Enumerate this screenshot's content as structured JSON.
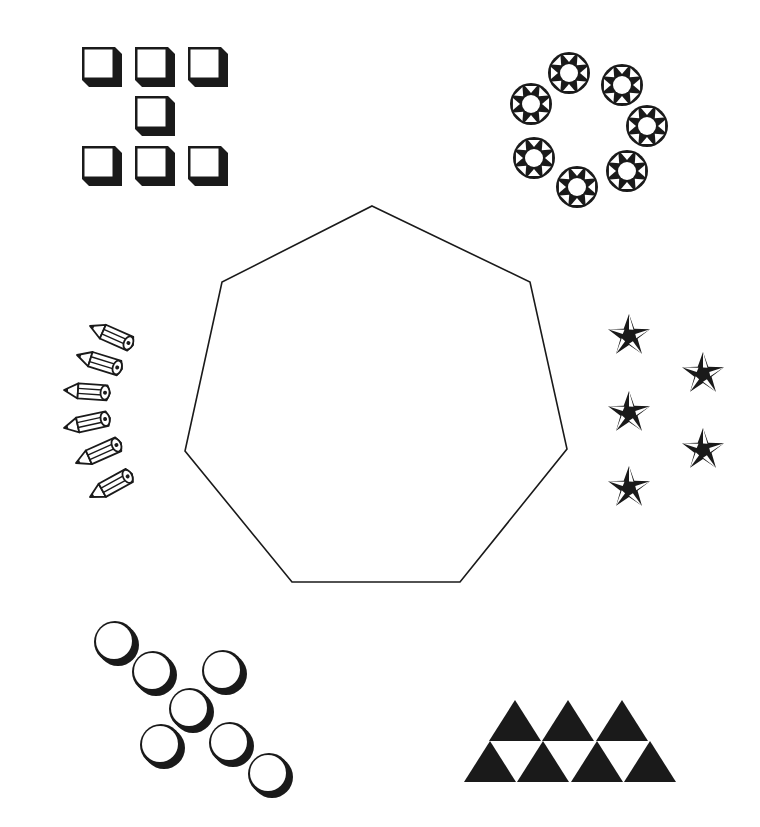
{
  "colors": {
    "ink": "#1a1a1a",
    "background": "#ffffff"
  },
  "center_shape": {
    "name": "heptagon",
    "sides": 7,
    "points": [
      [
        372,
        206
      ],
      [
        530,
        282
      ],
      [
        567,
        449
      ],
      [
        460,
        582
      ],
      [
        292,
        582
      ],
      [
        185,
        451
      ],
      [
        222,
        282
      ]
    ]
  },
  "groups": [
    {
      "name": "cubes",
      "icon": "cube-icon",
      "count": 7,
      "position": "top-left",
      "items": [
        [
          82,
          47
        ],
        [
          135,
          47
        ],
        [
          188,
          47
        ],
        [
          135,
          96
        ],
        [
          82,
          146
        ],
        [
          135,
          146
        ],
        [
          188,
          146
        ]
      ]
    },
    {
      "name": "sun-rings",
      "icon": "sun-ring-icon",
      "count": 7,
      "position": "top-right",
      "items": [
        [
          569,
          73
        ],
        [
          622,
          85
        ],
        [
          647,
          126
        ],
        [
          627,
          171
        ],
        [
          577,
          187
        ],
        [
          534,
          158
        ],
        [
          531,
          104
        ]
      ]
    },
    {
      "name": "pencils",
      "icon": "pencil-icon",
      "count": 6,
      "position": "middle-left",
      "items": [
        {
          "tip": [
            90,
            326
          ],
          "end": [
            133,
            345
          ]
        },
        {
          "tip": [
            77,
            355
          ],
          "end": [
            122,
            369
          ]
        },
        {
          "tip": [
            64,
            390
          ],
          "end": [
            110,
            393
          ]
        },
        {
          "tip": [
            64,
            428
          ],
          "end": [
            110,
            418
          ]
        },
        {
          "tip": [
            76,
            463
          ],
          "end": [
            121,
            443
          ]
        },
        {
          "tip": [
            90,
            497
          ],
          "end": [
            132,
            474
          ]
        }
      ]
    },
    {
      "name": "stars",
      "icon": "star-icon",
      "count": 5,
      "position": "middle-right",
      "items": [
        [
          629,
          336
        ],
        [
          703,
          374
        ],
        [
          629,
          413
        ],
        [
          703,
          450
        ],
        [
          629,
          488
        ]
      ]
    },
    {
      "name": "circles",
      "icon": "circle-icon",
      "count": 7,
      "position": "bottom-left",
      "items": [
        [
          115,
          642
        ],
        [
          153,
          672
        ],
        [
          223,
          671
        ],
        [
          190,
          709
        ],
        [
          161,
          745
        ],
        [
          230,
          743
        ],
        [
          269,
          774
        ]
      ]
    },
    {
      "name": "triangles",
      "icon": "triangle-icon",
      "count": 7,
      "position": "bottom-right",
      "items": [
        [
          515,
          700
        ],
        [
          568,
          700
        ],
        [
          622,
          700
        ],
        [
          490,
          741
        ],
        [
          543,
          741
        ],
        [
          597,
          741
        ],
        [
          650,
          741
        ]
      ]
    }
  ]
}
